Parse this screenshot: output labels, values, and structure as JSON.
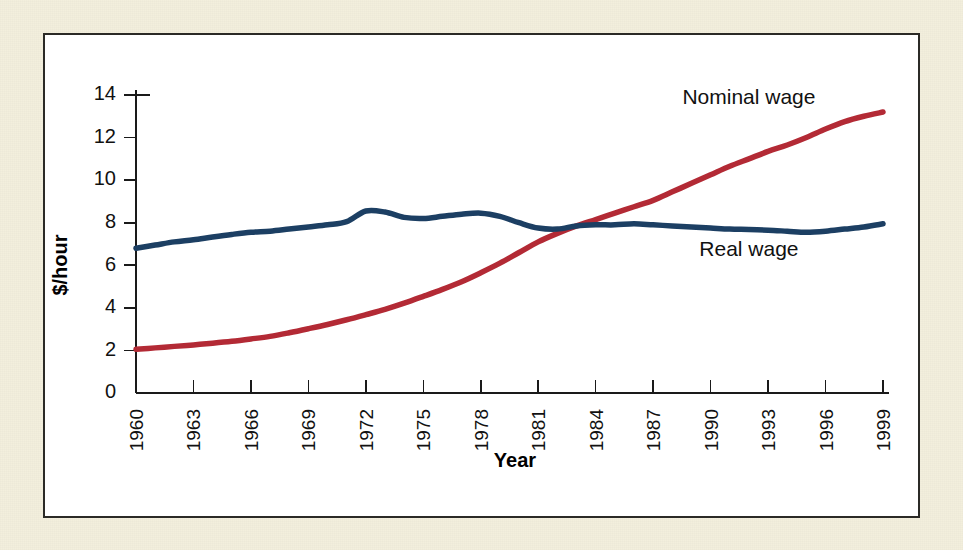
{
  "figure": {
    "outer_background": "#f3efdd",
    "panel_background": "#ffffff",
    "panel_border_color": "#2b2a26"
  },
  "chart_data": {
    "type": "line",
    "title": "",
    "subtitle": "",
    "xlabel": "Year",
    "ylabel": "$/hour",
    "xlim": [
      1960,
      1999
    ],
    "ylim": [
      0,
      14
    ],
    "yticks": [
      0,
      2,
      4,
      6,
      8,
      10,
      12,
      14
    ],
    "xticks": [
      1960,
      1963,
      1966,
      1969,
      1972,
      1975,
      1978,
      1981,
      1984,
      1987,
      1990,
      1993,
      1996,
      1999
    ],
    "xtick_labels": [
      "1960",
      "1963",
      "1966",
      "1969",
      "1972",
      "1975",
      "1978",
      "1981",
      "1984",
      "1987",
      "1990",
      "1993",
      "1996",
      "1999"
    ],
    "xtick_rotation": 90,
    "ytick_labels": [
      "0",
      "2",
      "4",
      "6",
      "8",
      "10",
      "12",
      "14"
    ],
    "grid": false,
    "legend_position": "inline-annotation",
    "x": [
      1960,
      1961,
      1962,
      1963,
      1964,
      1965,
      1966,
      1967,
      1968,
      1969,
      1970,
      1971,
      1972,
      1973,
      1974,
      1975,
      1976,
      1977,
      1978,
      1979,
      1980,
      1981,
      1982,
      1983,
      1984,
      1985,
      1986,
      1987,
      1988,
      1989,
      1990,
      1991,
      1992,
      1993,
      1994,
      1995,
      1996,
      1997,
      1998,
      1999
    ],
    "series": [
      {
        "name": "Nominal wage",
        "color": "#b32a35",
        "label_anchor_year": 1992,
        "label_anchor_value": 13.6,
        "values": [
          2.05,
          2.12,
          2.19,
          2.26,
          2.34,
          2.43,
          2.54,
          2.66,
          2.83,
          3.02,
          3.22,
          3.44,
          3.68,
          3.93,
          4.22,
          4.54,
          4.87,
          5.23,
          5.65,
          6.1,
          6.6,
          7.1,
          7.5,
          7.85,
          8.15,
          8.45,
          8.75,
          9.05,
          9.45,
          9.85,
          10.25,
          10.65,
          11.0,
          11.35,
          11.65,
          12.0,
          12.4,
          12.75,
          13.0,
          13.2
        ]
      },
      {
        "name": "Real wage",
        "color": "#1c3f63",
        "label_anchor_year": 1992,
        "label_anchor_value": 6.45,
        "values": [
          6.8,
          6.95,
          7.1,
          7.2,
          7.33,
          7.45,
          7.55,
          7.6,
          7.7,
          7.8,
          7.9,
          8.05,
          8.55,
          8.5,
          8.25,
          8.2,
          8.3,
          8.4,
          8.45,
          8.3,
          8.0,
          7.75,
          7.7,
          7.85,
          7.9,
          7.9,
          7.95,
          7.9,
          7.85,
          7.8,
          7.75,
          7.7,
          7.68,
          7.65,
          7.6,
          7.55,
          7.6,
          7.7,
          7.8,
          7.95
        ]
      }
    ],
    "annotations": [
      {
        "text": "Nominal wage",
        "series": "Nominal wage"
      },
      {
        "text": "Real wage",
        "series": "Real wage"
      }
    ]
  }
}
